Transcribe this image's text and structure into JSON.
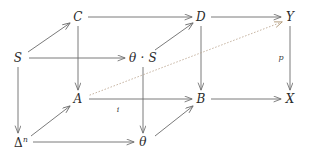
{
  "diagram": {
    "type": "commutative-cube-diagram",
    "width": 313,
    "height": 160,
    "background": "#ffffff",
    "stroke_color": "#6b6b6b",
    "dotted_color": "#b9a38c",
    "text_color": "#2b2b2b",
    "nodes": [
      {
        "id": "C",
        "label": "C",
        "x": 78,
        "y": 17
      },
      {
        "id": "D",
        "label": "D",
        "x": 201,
        "y": 17
      },
      {
        "id": "Y",
        "label": "Y",
        "x": 290,
        "y": 17
      },
      {
        "id": "S",
        "label": "S",
        "x": 18,
        "y": 58
      },
      {
        "id": "thetaS",
        "label": "θ · S",
        "x": 143,
        "y": 58
      },
      {
        "id": "A",
        "label": "A",
        "x": 78,
        "y": 99
      },
      {
        "id": "B",
        "label": "B",
        "x": 201,
        "y": 99
      },
      {
        "id": "X",
        "label": "X",
        "x": 290,
        "y": 99
      },
      {
        "id": "Deltan",
        "label": "Δ",
        "superscript": "n",
        "x": 18,
        "y": 142
      },
      {
        "id": "theta",
        "label": "θ",
        "x": 143,
        "y": 142
      }
    ],
    "edges": [
      {
        "id": "C-D",
        "from": "C",
        "to": "D",
        "style": "solid",
        "label": ""
      },
      {
        "id": "D-Y",
        "from": "D",
        "to": "Y",
        "style": "solid",
        "label": ""
      },
      {
        "id": "S-thetaS",
        "from": "S",
        "to": "thetaS",
        "style": "solid",
        "label": ""
      },
      {
        "id": "A-B",
        "from": "A",
        "to": "B",
        "style": "solid",
        "label": "i"
      },
      {
        "id": "B-X",
        "from": "B",
        "to": "X",
        "style": "solid",
        "label": ""
      },
      {
        "id": "Deltan-theta",
        "from": "Deltan",
        "to": "theta",
        "style": "solid",
        "label": ""
      },
      {
        "id": "C-A",
        "from": "C",
        "to": "A",
        "style": "solid",
        "label": ""
      },
      {
        "id": "D-B",
        "from": "D",
        "to": "B",
        "style": "solid",
        "label": ""
      },
      {
        "id": "Y-X",
        "from": "Y",
        "to": "X",
        "style": "solid",
        "label": "p"
      },
      {
        "id": "S-Deltan",
        "from": "S",
        "to": "Deltan",
        "style": "solid",
        "label": ""
      },
      {
        "id": "thetaS-theta",
        "from": "thetaS",
        "to": "theta",
        "style": "solid",
        "label": ""
      },
      {
        "id": "S-C",
        "from": "S",
        "to": "C",
        "style": "solid",
        "label": ""
      },
      {
        "id": "thetaS-D",
        "from": "thetaS",
        "to": "D",
        "style": "solid",
        "label": ""
      },
      {
        "id": "Deltan-A",
        "from": "Deltan",
        "to": "A",
        "style": "solid",
        "label": ""
      },
      {
        "id": "theta-B",
        "from": "theta",
        "to": "B",
        "style": "solid",
        "label": ""
      },
      {
        "id": "A-Y",
        "from": "A",
        "to": "Y",
        "style": "dotted",
        "label": ""
      }
    ],
    "edge_labels": [
      {
        "id": "label-i",
        "text": "i",
        "x": 118,
        "y": 110
      },
      {
        "id": "label-p",
        "text": "p",
        "x": 281,
        "y": 58
      }
    ]
  }
}
